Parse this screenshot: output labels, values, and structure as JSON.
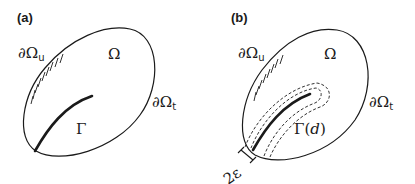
{
  "panels": [
    {
      "label": "(a)",
      "domain_label": "Ω",
      "boundary_u": {
        "main": "∂Ω",
        "sub": "u"
      },
      "boundary_t": {
        "main": "∂Ω",
        "sub": "t"
      },
      "crack_label": "Γ"
    },
    {
      "label": "(b)",
      "domain_label": "Ω",
      "boundary_u": {
        "main": "∂Ω",
        "sub": "u"
      },
      "boundary_t": {
        "main": "∂Ω",
        "sub": "t"
      },
      "crack_label": "Γ(",
      "crack_label_arg": "d",
      "crack_label_close": ")",
      "width_label": "2ε"
    }
  ],
  "colors": {
    "stroke": "#1a1a1a",
    "background": "#ffffff"
  }
}
